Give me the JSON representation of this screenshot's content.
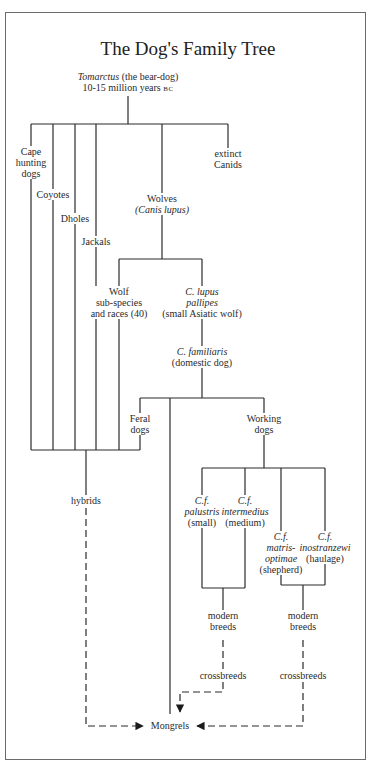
{
  "title": "The Dog's Family Tree",
  "nodes": {
    "root": {
      "name": "Tomarctus",
      "desc": "(the bear-dog)",
      "age_prefix": "10-15 million years",
      "age_era": "BC"
    },
    "cape_hunting_dogs": {
      "line1": "Cape",
      "line2": "hunting",
      "line3": "dogs"
    },
    "coyotes": {
      "label": "Coyotes"
    },
    "dholes": {
      "label": "Dholes"
    },
    "jackals": {
      "label": "Jackals"
    },
    "extinct_canids": {
      "line1": "extinct",
      "line2": "Canids"
    },
    "wolves": {
      "line1": "Wolves",
      "line2": "(Canis lupus)"
    },
    "wolf_subspecies": {
      "line1": "Wolf",
      "line2": "sub-species",
      "line3": "and races (40)"
    },
    "c_lupus_pallipes": {
      "line1": "C. lupus",
      "line2": "pallipes",
      "line3": "(small Asiatic wolf)"
    },
    "c_familiaris": {
      "line1": "C. familiaris",
      "line2": "(domestic dog)"
    },
    "feral_dogs": {
      "line1": "Feral",
      "line2": "dogs"
    },
    "working_dogs": {
      "line1": "Working",
      "line2": "dogs"
    },
    "hybrids": {
      "label": "hybrids"
    },
    "cf_palustris": {
      "line1": "C.f.",
      "line2": "palustris",
      "line3": "(small)"
    },
    "cf_intermedius": {
      "line1": "C.f.",
      "line2": "intermedius",
      "line3": "(medium)"
    },
    "cf_matris_optimae": {
      "line1": "C.f.",
      "line2": "matris-",
      "line3": "optimae",
      "line4": "(shepherd)"
    },
    "cf_inostranzewi": {
      "line1": "C.f.",
      "line2": "inostranzewi",
      "line3": "(haulage)"
    },
    "modern_breeds_left": {
      "line1": "modern",
      "line2": "breeds"
    },
    "modern_breeds_right": {
      "line1": "modern",
      "line2": "breeds"
    },
    "crossbreeds_left": {
      "label": "crossbreeds"
    },
    "crossbreeds_right": {
      "label": "crossbreeds"
    },
    "mongrels": {
      "label": "Mongrels"
    }
  },
  "colors": {
    "line": "#2a2a2a",
    "border": "#6a6a6a",
    "background": "#ffffff"
  }
}
